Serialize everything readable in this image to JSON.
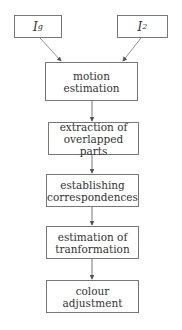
{
  "diagram": {
    "inputs": [
      {
        "label": "I",
        "subscript": "g"
      },
      {
        "label": "I",
        "subscript": "2"
      }
    ],
    "steps": [
      {
        "line1": "motion",
        "line2": "estimation"
      },
      {
        "line1": "extraction of",
        "line2": "overlapped parts"
      },
      {
        "line1": "establishing",
        "line2": "correspondences"
      },
      {
        "line1": "estimation of",
        "line2": "tranformation"
      },
      {
        "line1": "colour",
        "line2": "adjustment"
      }
    ],
    "colors": {
      "border": "#777777",
      "arrow": "#555555",
      "text": "#333333"
    }
  }
}
